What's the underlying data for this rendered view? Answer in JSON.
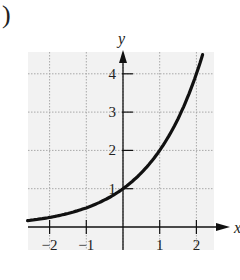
{
  "figure_label": ")",
  "chart_data": {
    "type": "line",
    "title": "",
    "function": "y = 2^x",
    "xlabel": "x",
    "ylabel": "y",
    "xlim": [
      -2.6,
      2.5
    ],
    "ylim": [
      -0.6,
      4.6
    ],
    "x_ticks": [
      -2,
      -1,
      1,
      2
    ],
    "x_tick_labels": [
      "−2",
      "−1",
      "1",
      "2"
    ],
    "y_ticks": [
      1,
      2,
      3,
      4
    ],
    "y_tick_labels": [
      "1",
      "2",
      "3",
      "4"
    ],
    "grid": true,
    "series": [
      {
        "name": "curve",
        "x": [
          -2.6,
          -2,
          -1.5,
          -1,
          -0.5,
          0,
          0.5,
          1,
          1.5,
          2,
          2.17
        ],
        "y": [
          0.165,
          0.25,
          0.354,
          0.5,
          0.707,
          1,
          1.414,
          2,
          2.828,
          4,
          4.5
        ]
      }
    ]
  }
}
